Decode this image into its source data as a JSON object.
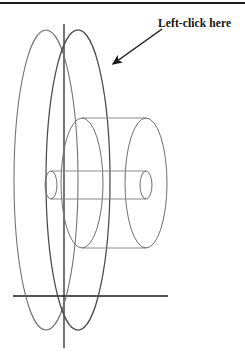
{
  "page": {
    "background_color": "#ffffff",
    "width": 245,
    "height": 352,
    "top_rule_color": "#1c1c1c"
  },
  "annotation": {
    "label": "Left-click here",
    "text_color": "#111111",
    "arrow": {
      "name": "pointer-arrow",
      "color": "#1a1a1a",
      "from_x": 162,
      "from_y": 29,
      "to_x": 110,
      "to_y": 66,
      "head_style": "filled-triangle"
    }
  },
  "drawing": {
    "title": "wireframe-flywheel-and-shaft",
    "stroke_color": "#6f6f6f",
    "stroke_color_dark": "#4a4a4a",
    "axis_color": "#1a1a1a",
    "axes": {
      "vertical": {
        "name": "vertical-axis",
        "x": 64,
        "y1": 24,
        "y2": 348
      },
      "horizontal": {
        "name": "horizontal-axis",
        "y": 296,
        "x1": 13,
        "x2": 168
      }
    },
    "large_disc_front": {
      "name": "large-disc-front-ellipse",
      "cx": 78,
      "cy": 180,
      "rx": 32,
      "ry": 150
    },
    "large_disc_back": {
      "name": "large-disc-back-ellipse",
      "cx": 46,
      "cy": 180,
      "rx": 32,
      "ry": 150
    },
    "medium_hub_front": {
      "name": "medium-hub-front-ellipse",
      "cx": 146,
      "cy": 183,
      "rx": 21,
      "ry": 65
    },
    "medium_hub_back": {
      "name": "medium-hub-back-ellipse",
      "cx": 82,
      "cy": 183,
      "rx": 21,
      "ry": 65
    },
    "medium_hub_top_line": {
      "name": "medium-hub-top-edge",
      "x1": 82,
      "x2": 146,
      "y": 118
    },
    "medium_hub_bottom_line": {
      "name": "medium-hub-bottom-edge",
      "x1": 82,
      "x2": 146,
      "y": 248
    },
    "shaft_front": {
      "name": "shaft-front-ellipse",
      "cx": 146,
      "cy": 185,
      "rx": 6,
      "ry": 14
    },
    "shaft_back": {
      "name": "shaft-back-ellipse",
      "cx": 51,
      "cy": 185,
      "rx": 6,
      "ry": 14
    },
    "shaft_top_line": {
      "name": "shaft-top-edge",
      "x1": 51,
      "x2": 146,
      "y": 171
    },
    "shaft_bottom_line": {
      "name": "shaft-bottom-edge",
      "x1": 51,
      "x2": 146,
      "y": 199
    }
  }
}
